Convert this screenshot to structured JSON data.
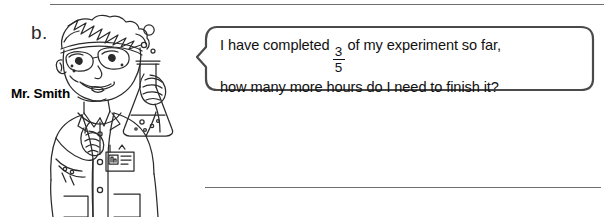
{
  "worksheet": {
    "problem_letter": "b.",
    "character_name": "Mr. Smith",
    "speech": {
      "line1_before_fraction": "I have completed",
      "fraction_numerator": "3",
      "fraction_denominator": "5",
      "line1_after_fraction": "of my experiment so far,",
      "line2": "how many more hours do I need to finish it?"
    },
    "answer_line_label": "",
    "colors": {
      "ink": "#1a1a1a",
      "rule": "#6e6e6e",
      "bubble_border": "#4a4a4a",
      "page_background": "#ffffff"
    },
    "icons": {
      "character": "scientist-figure",
      "flask": "erlenmeyer-flask-icon",
      "goggles": "safety-goggles-icon",
      "badge": "id-badge-icon",
      "bubbles": "bubble-icon"
    }
  }
}
